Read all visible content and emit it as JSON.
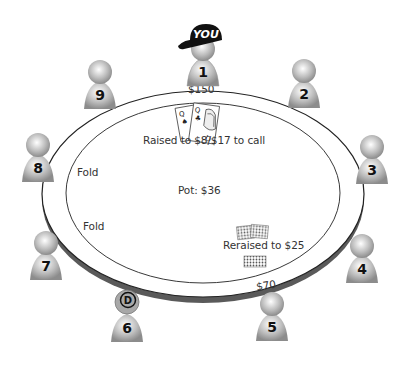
{
  "scene": {
    "description": "Nine-handed poker table diagram",
    "colors": {
      "felt": "#ffffff",
      "rail_shadow": "#555555",
      "pawn_light": "#e6e6e6",
      "pawn_dark": "#8a8a8a",
      "cap": "#111111",
      "text": "#333333"
    }
  },
  "hero_marker": {
    "label": "YOU",
    "icon": "baseball-cap-icon"
  },
  "dealer_button": {
    "label": "D",
    "seat": 6
  },
  "pot": {
    "label": "Pot: $36"
  },
  "seats": [
    {
      "number": "1",
      "stack": "$150",
      "action": "Raised to $8/$17 to call",
      "cards": [
        "Q♠",
        "Q♣"
      ],
      "is_hero": true
    },
    {
      "number": "2"
    },
    {
      "number": "3"
    },
    {
      "number": "4"
    },
    {
      "number": "5",
      "stack": "$70",
      "action": "Reraised to $25",
      "cards": [
        "face-down",
        "face-down"
      ]
    },
    {
      "number": "6",
      "dealer": true
    },
    {
      "number": "7",
      "action": "Fold"
    },
    {
      "number": "8",
      "action": "Fold"
    },
    {
      "number": "9"
    }
  ]
}
